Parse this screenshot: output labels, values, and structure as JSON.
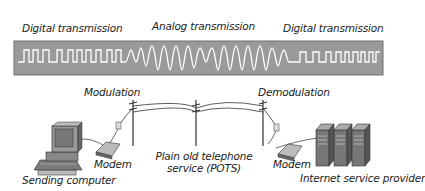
{
  "signal_band": {
    "labels": {
      "left": "Digital transmission",
      "middle": "Analog transmission",
      "right": "Digital transmission"
    },
    "band_color": "#9a9a9a",
    "signal_color": "#ffffff"
  },
  "network": {
    "modulation_label": "Modulation",
    "demodulation_label": "Demodulation",
    "pots_label_line1": "Plain old telephone",
    "pots_label_line2": "service (POTS)",
    "left_modem_label": "Modem",
    "right_modem_label": "Modem",
    "sender_label": "Sending computer",
    "isp_label": "Internet service provider"
  }
}
